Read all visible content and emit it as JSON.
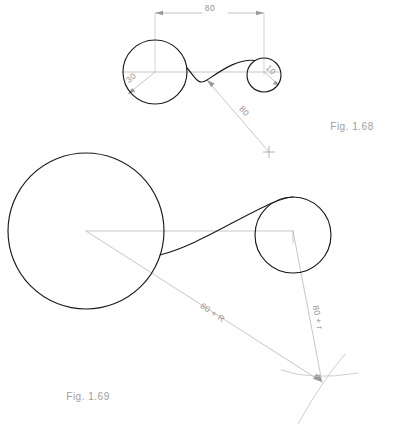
{
  "sheet": {
    "title": "Tangent arc constructions",
    "width": 396,
    "height": 426,
    "background_color": "#ffffff",
    "object_line_color": "#1a1a1a",
    "construction_line_color": "#bcbcbc",
    "text_color": "#949494"
  },
  "figures": [
    {
      "id": "fig-1-68",
      "caption": "Fig. 1.68",
      "caption_x": 352,
      "caption_y": 130,
      "description": "Reverse (ogee) curve joining two circles",
      "circles": [
        {
          "name": "large-circle",
          "label": "30",
          "cx": 155,
          "cy": 72,
          "r": 32
        },
        {
          "name": "small-circle",
          "label": "10",
          "cx": 264,
          "cy": 75,
          "r": 17
        }
      ],
      "dimensions": [
        {
          "name": "center-distance",
          "value": "80",
          "x": 210,
          "y": 10
        },
        {
          "name": "radius-large",
          "value": "30",
          "x": 133,
          "y": 80
        },
        {
          "name": "radius-small",
          "value": "10",
          "x": 269,
          "y": 72
        },
        {
          "name": "construction-radius",
          "value": "80",
          "x": 242,
          "y": 113
        }
      ],
      "center_mark": {
        "name": "arc-center-mark",
        "x": 269,
        "y": 152
      }
    },
    {
      "id": "fig-1-69",
      "caption": "Fig. 1.69",
      "caption_x": 62,
      "caption_y": 400,
      "description": "Arc of radius 80 tangent to two circles",
      "circles": [
        {
          "name": "large-circle",
          "label": "R",
          "cx": 86,
          "cy": 231,
          "r": 78
        },
        {
          "name": "small-circle",
          "label": "r",
          "cx": 293,
          "cy": 235,
          "r": 38
        }
      ],
      "dimensions": [
        {
          "name": "radius-sum-large",
          "value": "80 + R",
          "x": 211,
          "y": 315
        },
        {
          "name": "radius-sum-small",
          "value": "80 + r",
          "x": 315,
          "y": 318
        }
      ],
      "intersection_point": {
        "name": "arc-center-intersection",
        "x": 322,
        "y": 382
      }
    }
  ]
}
